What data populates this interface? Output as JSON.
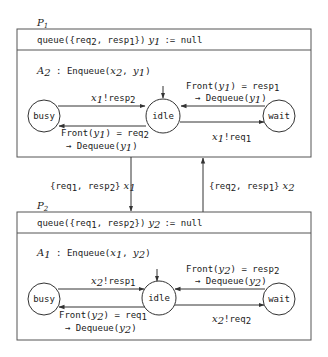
{
  "processes": [
    {
      "name": "P1",
      "name_main": "P",
      "name_sub": "1",
      "declaration": {
        "queue_prefix": "queue({",
        "item1": "req",
        "item1_sub": "2",
        "sep": ", ",
        "item2": "resp",
        "item2_sub": "1",
        "queue_suffix": "})",
        "var": "y",
        "var_sub": "1",
        "assign": ":= null"
      },
      "automaton": {
        "name": "A",
        "name_sub": "2",
        "label_sep": " : ",
        "action": "Enqueue(",
        "arg1": "x",
        "arg1_sub": "2",
        "arg2": "y",
        "arg2_sub": "1",
        "close": ")"
      },
      "states": [
        "busy",
        "idle",
        "wait"
      ],
      "transitions": {
        "busy_to_idle": {
          "chan": "x",
          "chan_sub": "1",
          "op": "!resp",
          "op_sub": "2"
        },
        "idle_to_busy": {
          "line1_a": "Front(",
          "var": "y",
          "var_sub": "1",
          "line1_b": ") = req",
          "val_sub": "2",
          "line2_a": "→ Dequeue(",
          "line2_b": ")"
        },
        "wait_to_idle": {
          "line1_a": "Front(",
          "var": "y",
          "var_sub": "1",
          "line1_b": ") = resp",
          "val_sub": "1",
          "line2_a": "→ Dequeue(",
          "line2_b": ")"
        },
        "idle_to_wait": {
          "chan": "x",
          "chan_sub": "1",
          "op": "!req",
          "op_sub": "1"
        }
      }
    },
    {
      "name": "P2",
      "name_main": "P",
      "name_sub": "2",
      "declaration": {
        "queue_prefix": "queue({",
        "item1": "req",
        "item1_sub": "1",
        "sep": ", ",
        "item2": "resp",
        "item2_sub": "2",
        "queue_suffix": "})",
        "var": "y",
        "var_sub": "2",
        "assign": ":= null"
      },
      "automaton": {
        "name": "A",
        "name_sub": "1",
        "label_sep": " : ",
        "action": "Enqueue(",
        "arg1": "x",
        "arg1_sub": "1",
        "arg2": "y",
        "arg2_sub": "2",
        "close": ")"
      },
      "states": [
        "busy",
        "idle",
        "wait"
      ],
      "transitions": {
        "busy_to_idle": {
          "chan": "x",
          "chan_sub": "2",
          "op": "!resp",
          "op_sub": "1"
        },
        "idle_to_busy": {
          "line1_a": "Front(",
          "var": "y",
          "var_sub": "2",
          "line1_b": ") = req",
          "val_sub": "1",
          "line2_a": "→ Dequeue(",
          "line2_b": ")"
        },
        "wait_to_idle": {
          "line1_a": "Front(",
          "var": "y",
          "var_sub": "2",
          "line1_b": ") = resp",
          "val_sub": "2",
          "line2_a": "→ Dequeue(",
          "line2_b": ")"
        },
        "idle_to_wait": {
          "chan": "x",
          "chan_sub": "2",
          "op": "!req",
          "op_sub": "2"
        }
      }
    }
  ],
  "channels": [
    {
      "direction": "P1 to P2",
      "open": "{",
      "item1": "req",
      "item1_sub": "1",
      "sep": ", ",
      "item2": "resp",
      "item2_sub": "2",
      "close": "}",
      "var": "x",
      "var_sub": "1"
    },
    {
      "direction": "P2 to P1",
      "open": "{",
      "item1": "req",
      "item1_sub": "2",
      "sep": ", ",
      "item2": "resp",
      "item2_sub": "1",
      "close": "}",
      "var": "x",
      "var_sub": "2"
    }
  ]
}
